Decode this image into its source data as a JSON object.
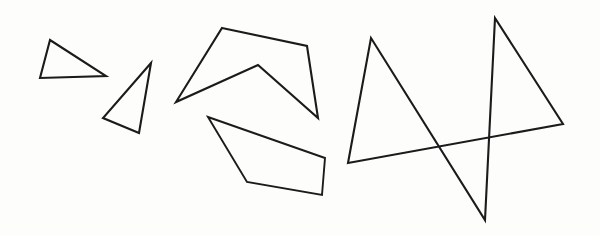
{
  "canvas": {
    "width": 600,
    "height": 236,
    "background_color": "#fdfdfc",
    "ink_color": "#1b1b1b",
    "stroke_width": 2.1,
    "description": "Hand-drawn black outline geometric shapes on white paper"
  },
  "shapes": [
    {
      "id": "triangle-small-left",
      "name": "small-triangle",
      "type": "polygon",
      "closed": true,
      "sides": 3,
      "points": "50,40 40,78 106,76",
      "label": "Triangle 1"
    },
    {
      "id": "triangle-small-right",
      "name": "second-triangle",
      "type": "polygon",
      "closed": true,
      "sides": 3,
      "points": "151,63 103,118 139,133",
      "label": "Triangle 2"
    },
    {
      "id": "chevron-concave",
      "name": "concave-chevron",
      "type": "polygon",
      "closed": true,
      "sides": 5,
      "points": "222,28 307,46 318,118 258,65 176,102",
      "label": "Concave pentagon"
    },
    {
      "id": "quadrilateral",
      "name": "slanted-quadrilateral",
      "type": "polygon",
      "closed": true,
      "sides": 4,
      "points": "208,117 325,158 322,195 247,182",
      "label": "Quadrilateral"
    },
    {
      "id": "star-pentagram",
      "name": "five-pointed-star",
      "type": "polygon",
      "closed": true,
      "sides": 5,
      "points": "495,18 563,124 348,163 371,38 485,220",
      "label": "Five pointed star"
    }
  ]
}
